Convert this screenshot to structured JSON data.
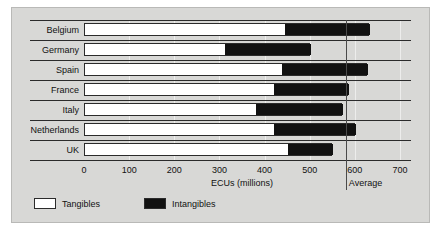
{
  "chart_data": {
    "type": "bar",
    "orientation": "horizontal",
    "stacked": true,
    "title": "",
    "xlabel": "ECUs (millions)",
    "ylabel": "",
    "xlim": [
      0,
      700
    ],
    "xticks": [
      0,
      100,
      200,
      300,
      400,
      500,
      600,
      700
    ],
    "xtick_labels": [
      "0",
      "100",
      "200",
      "300",
      "400",
      "500",
      "600",
      "700"
    ],
    "grid": true,
    "grid_axis": "x",
    "categories": [
      "Belgium",
      "Germany",
      "Spain",
      "France",
      "Italy",
      "Netherlands",
      "UK"
    ],
    "series": [
      {
        "name": "Tangibles",
        "color": "#ffffff",
        "values": [
          444,
          311,
          436,
          418,
          378,
          418,
          449
        ]
      },
      {
        "name": "Intangibles",
        "color": "#111111",
        "values": [
          187,
          189,
          191,
          166,
          193,
          182,
          100
        ]
      }
    ],
    "totals": [
      631,
      500,
      627,
      584,
      571,
      600,
      549
    ],
    "annotations": [
      {
        "name": "average-line",
        "label": "Average",
        "value": 580,
        "orientation": "vertical",
        "color": "#4a4a4a"
      }
    ],
    "legend": {
      "position": "bottom-left",
      "entries": [
        {
          "label": "Tangibles",
          "color": "#ffffff",
          "border": "#2b2b2b"
        },
        {
          "label": "Intangibles",
          "color": "#111111",
          "border": "#2b2b2b"
        }
      ]
    }
  },
  "figure": {
    "background": "#d8d8d6",
    "axis_color": "#2b2b2b",
    "bar_border": "#2b2b2b"
  }
}
